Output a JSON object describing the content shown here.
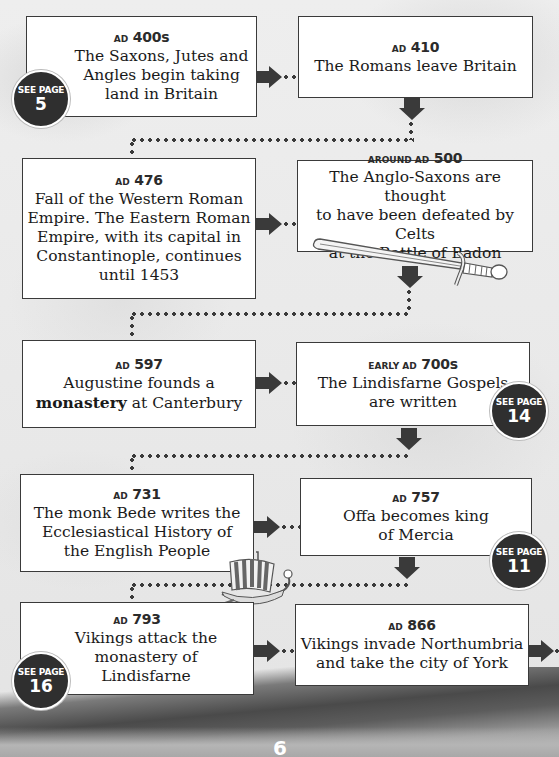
{
  "page": {
    "number": "6"
  },
  "events": [
    {
      "id": "ad400s",
      "date_prefix": "AD",
      "date_main": "400s",
      "text": "The Saxons, Jutes and\nAngles begin taking\nland in Britain",
      "see_page": "5"
    },
    {
      "id": "ad410",
      "date_prefix": "AD",
      "date_main": "410",
      "text": "The Romans leave Britain"
    },
    {
      "id": "ad476",
      "date_prefix": "AD",
      "date_main": "476",
      "text": "Fall of the Western Roman\nEmpire. The Eastern Roman\nEmpire, with its capital in\nConstantinople, continues\nuntil 1453"
    },
    {
      "id": "ad500",
      "date_prefix": "AROUND AD",
      "date_main": "500",
      "text": "The Anglo-Saxons are thought\nto have been defeated by Celts\nat the Battle of Badon"
    },
    {
      "id": "ad597",
      "date_prefix": "AD",
      "date_main": "597",
      "text_before": "Augustine founds a\n",
      "text_bold": "monastery",
      "text_after": " at Canterbury"
    },
    {
      "id": "ad700s",
      "date_prefix": "EARLY AD",
      "date_main": "700s",
      "text": "The Lindisfarne Gospels\nare written",
      "see_page": "14"
    },
    {
      "id": "ad731",
      "date_prefix": "AD",
      "date_main": "731",
      "text": "The monk Bede writes the\nEcclesiastical History of\nthe English People"
    },
    {
      "id": "ad757",
      "date_prefix": "AD",
      "date_main": "757",
      "text": "Offa becomes king\nof Mercia",
      "see_page": "11"
    },
    {
      "id": "ad793",
      "date_prefix": "AD",
      "date_main": "793",
      "text": "Vikings attack the\nmonastery of\nLindisfarne",
      "see_page": "16"
    },
    {
      "id": "ad866",
      "date_prefix": "AD",
      "date_main": "866",
      "text": "Vikings invade Northumbria\nand take the city of York"
    }
  ],
  "badge_label": "SEE PAGE",
  "illustrations": [
    "sword",
    "viking-longship"
  ],
  "colors": {
    "box_border": "#3a3a3a",
    "arrow": "#3a3a3a",
    "badge": "#2f2f2f",
    "background": "#ececec"
  }
}
